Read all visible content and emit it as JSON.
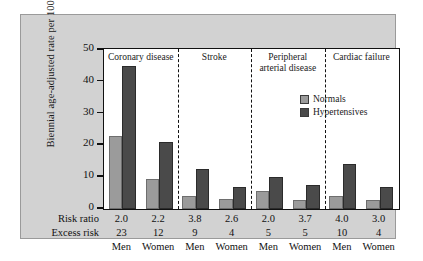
{
  "chart_data": {
    "type": "bar",
    "title": "",
    "xlabel": "",
    "ylabel": "Biennial age-adjusted rate per 1000",
    "ylim": [
      0,
      50
    ],
    "yticks": [
      0,
      10,
      20,
      30,
      40,
      50
    ],
    "grid": false,
    "legend_position": "inside-upper-right",
    "groups": [
      {
        "label": "Coronary disease",
        "lines": [
          "Coronary disease"
        ]
      },
      {
        "label": "Stroke",
        "lines": [
          "Stroke"
        ]
      },
      {
        "label": "Peripheral arterial disease",
        "lines": [
          "Peripheral",
          "arterial disease"
        ]
      },
      {
        "label": "Cardiac failure",
        "lines": [
          "Cardiac failure"
        ]
      }
    ],
    "categories": [
      "Men",
      "Women",
      "Men",
      "Women",
      "Men",
      "Women",
      "Men",
      "Women"
    ],
    "series": [
      {
        "name": "Normals",
        "color": "#9b9b9b",
        "values": [
          23,
          9.5,
          4,
          3.2,
          5.7,
          2.8,
          4.2,
          2.8
        ]
      },
      {
        "name": "Hypertensives",
        "color": "#4a4a4a",
        "values": [
          45,
          21,
          12.5,
          7,
          10,
          7.7,
          14,
          7
        ]
      }
    ],
    "annotations": {
      "risk_ratio_label": "Risk ratio",
      "risk_ratio": [
        "2.0",
        "2.2",
        "3.8",
        "2.6",
        "2.0",
        "3.7",
        "4.0",
        "3.0"
      ],
      "excess_risk_label": "Excess risk",
      "excess_risk": [
        "23",
        "12",
        "9",
        "4",
        "5",
        "5",
        "10",
        "4"
      ],
      "sex": [
        "Men",
        "Women",
        "Men",
        "Women",
        "Men",
        "Women",
        "Men",
        "Women"
      ]
    }
  }
}
